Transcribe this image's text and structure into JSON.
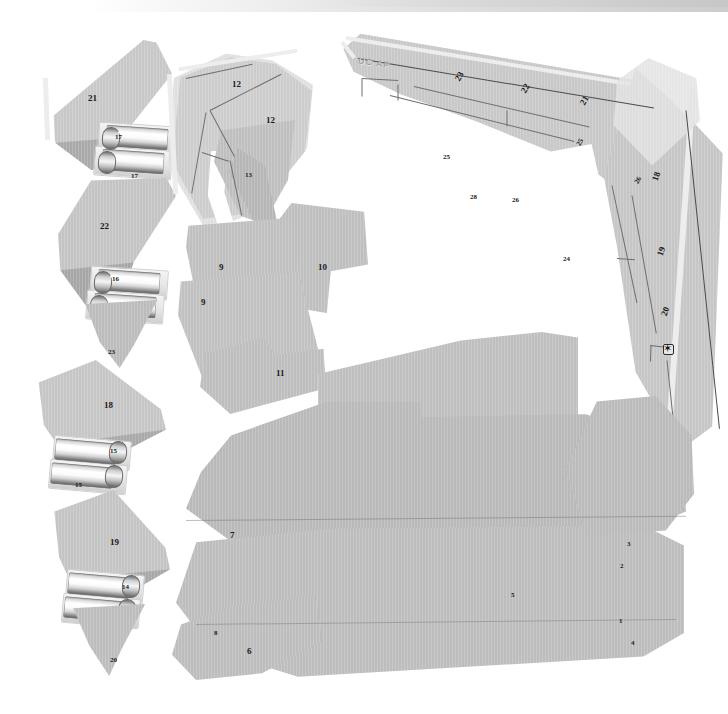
{
  "figure": {
    "background_color": "#ffffff",
    "panel_fill": "#c2c2c2",
    "label_color": "#1b1b1b",
    "width": 728,
    "height": 714,
    "embossed_marking": "UC AF"
  },
  "callouts": [
    {
      "id": "c21",
      "text": "21"
    },
    {
      "id": "c17a",
      "text": "17"
    },
    {
      "id": "c17b",
      "text": "17"
    },
    {
      "id": "c22l",
      "text": "22"
    },
    {
      "id": "c16a",
      "text": "16"
    },
    {
      "id": "c16b",
      "text": "16"
    },
    {
      "id": "c23l",
      "text": "23"
    },
    {
      "id": "c18l",
      "text": "18"
    },
    {
      "id": "c15a",
      "text": "15"
    },
    {
      "id": "c15b",
      "text": "15"
    },
    {
      "id": "c19l",
      "text": "19"
    },
    {
      "id": "c14a",
      "text": "14"
    },
    {
      "id": "c14b",
      "text": "14"
    },
    {
      "id": "c20l",
      "text": "20"
    },
    {
      "id": "c12a",
      "text": "12"
    },
    {
      "id": "c12b",
      "text": "12"
    },
    {
      "id": "c13",
      "text": "13"
    },
    {
      "id": "c9a",
      "text": "9"
    },
    {
      "id": "c9b",
      "text": "9"
    },
    {
      "id": "c10",
      "text": "10"
    },
    {
      "id": "c11",
      "text": "11"
    },
    {
      "id": "c23t",
      "text": "23"
    },
    {
      "id": "c22t",
      "text": "22"
    },
    {
      "id": "c21t",
      "text": "21"
    },
    {
      "id": "c25a",
      "text": "25"
    },
    {
      "id": "c25b",
      "text": "25"
    },
    {
      "id": "c26a",
      "text": "26"
    },
    {
      "id": "c26b",
      "text": "26"
    },
    {
      "id": "c28",
      "text": "28"
    },
    {
      "id": "c24",
      "text": "24"
    },
    {
      "id": "c18r",
      "text": "18"
    },
    {
      "id": "c19r",
      "text": "19"
    },
    {
      "id": "c20r",
      "text": "20"
    },
    {
      "id": "c7",
      "text": "7"
    },
    {
      "id": "c3",
      "text": "3"
    },
    {
      "id": "c2",
      "text": "2"
    },
    {
      "id": "c5",
      "text": "5"
    },
    {
      "id": "c1",
      "text": "1"
    },
    {
      "id": "c4",
      "text": "4"
    },
    {
      "id": "c8",
      "text": "8"
    },
    {
      "id": "c6",
      "text": "6"
    }
  ]
}
